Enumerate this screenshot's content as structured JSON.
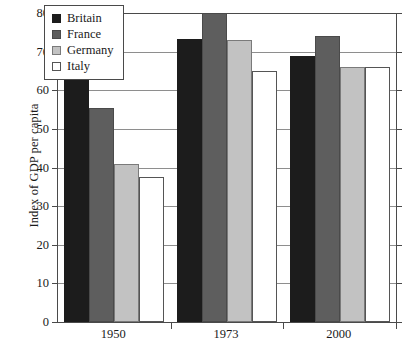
{
  "chart_data": {
    "type": "bar",
    "title": "",
    "xlabel": "",
    "ylabel": "Index of GDP per capita",
    "categories": [
      "1950",
      "1973",
      "2000"
    ],
    "series": [
      {
        "name": "Britain",
        "color": "#1c1c1c",
        "values": [
          72,
          73.2,
          69
        ]
      },
      {
        "name": "France",
        "color": "#5e5e5e",
        "values": [
          55.4,
          80,
          74
        ]
      },
      {
        "name": "Germany",
        "color": "#c2c2c2",
        "values": [
          41,
          73,
          66
        ]
      },
      {
        "name": "Italy",
        "color": "#ffffff",
        "values": [
          37.5,
          65,
          66
        ]
      }
    ],
    "ylim": [
      0,
      80
    ],
    "yticks": [
      0,
      10,
      20,
      30,
      40,
      50,
      60,
      70,
      80
    ],
    "ytick_labels": [
      "0",
      "10",
      "20",
      "30",
      "40",
      "50",
      "60",
      "70",
      "80"
    ],
    "grid": true,
    "grid_axis": "y",
    "legend_position": "upper-left-inside",
    "legend_entries": [
      "Britain",
      "France",
      "Germany",
      "Italy"
    ]
  }
}
